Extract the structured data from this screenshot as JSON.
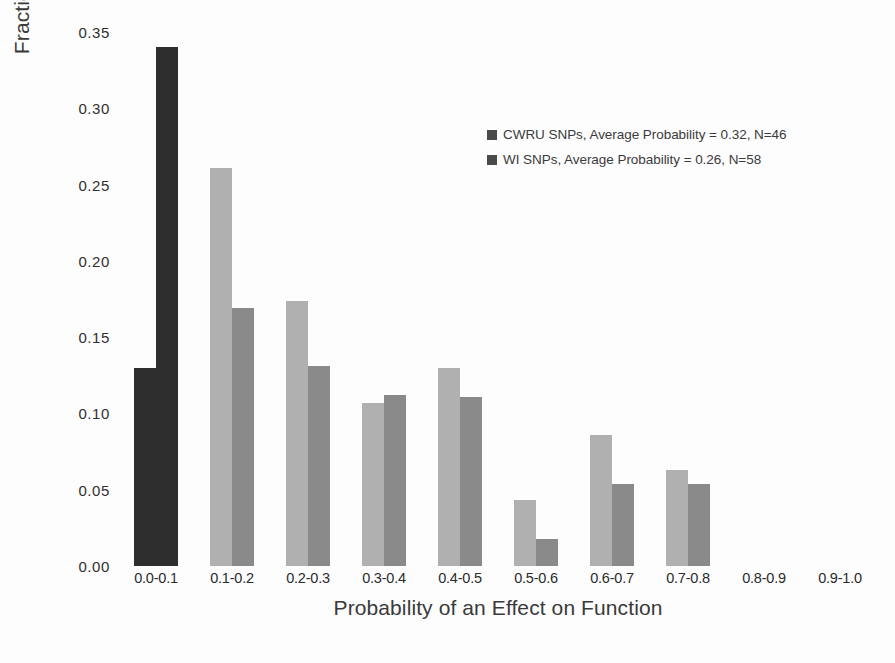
{
  "chart_data": {
    "type": "bar",
    "title": "",
    "xlabel": "Probability of an Effect on Function",
    "ylabel": "Fraction Modeled nsSNPs",
    "categories": [
      "0.0-0.1",
      "0.1-0.2",
      "0.2-0.3",
      "0.3-0.4",
      "0.4-0.5",
      "0.5-0.6",
      "0.6-0.7",
      "0.7-0.8",
      "0.8-0.9",
      "0.9-1.0"
    ],
    "series": [
      {
        "name": "CWRU SNPs, Average Probability = 0.32, N=46",
        "short_name": "CWRU SNPs",
        "color": "#b0b0b0",
        "values": [
          0.13,
          0.261,
          0.174,
          0.107,
          0.13,
          0.043,
          0.086,
          0.063,
          0.0,
          0.0
        ]
      },
      {
        "name": "WI SNPs, Average Probability = 0.26, N=58",
        "short_name": "WI SNPs",
        "color": "#8a8a8a",
        "values": [
          0.34,
          0.169,
          0.131,
          0.112,
          0.111,
          0.018,
          0.054,
          0.054,
          0.0,
          0.0
        ]
      }
    ],
    "bin_overrides": [
      {
        "index": 0,
        "cwru_color": "#2e2e2e",
        "wi_color": "#2e2e2e"
      }
    ],
    "ylim": [
      0.0,
      0.35
    ],
    "yticks": [
      "0.00",
      "0.05",
      "0.10",
      "0.15",
      "0.20",
      "0.25",
      "0.30",
      "0.35"
    ],
    "ytick_values": [
      0.0,
      0.05,
      0.1,
      0.15,
      0.2,
      0.25,
      0.3,
      0.35
    ],
    "grid": false,
    "legend_position": "upper right",
    "axis_line": false
  },
  "legend": {
    "entries": [
      {
        "label": "CWRU SNPs, Average Probability = 0.32, N=46",
        "color": "#4a4a4a"
      },
      {
        "label": "WI SNPs, Average Probability = 0.26, N=58",
        "color": "#4a4a4a"
      }
    ]
  },
  "caption": {
    "text": ""
  }
}
